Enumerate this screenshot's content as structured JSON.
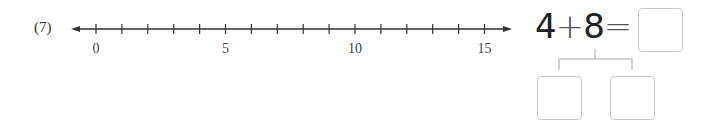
{
  "problem": {
    "number_label": "(7)",
    "number_line": {
      "min": 0,
      "max": 15,
      "tick_step": 1,
      "labels": [
        "0",
        "5",
        "10",
        "15"
      ],
      "label_values": [
        0,
        5,
        10,
        15
      ]
    },
    "equation": {
      "operand_a": "4",
      "operator": "+",
      "operand_b": "8",
      "equals": "=",
      "answer_value": ""
    },
    "decomposition": {
      "left_value": "",
      "right_value": ""
    }
  }
}
